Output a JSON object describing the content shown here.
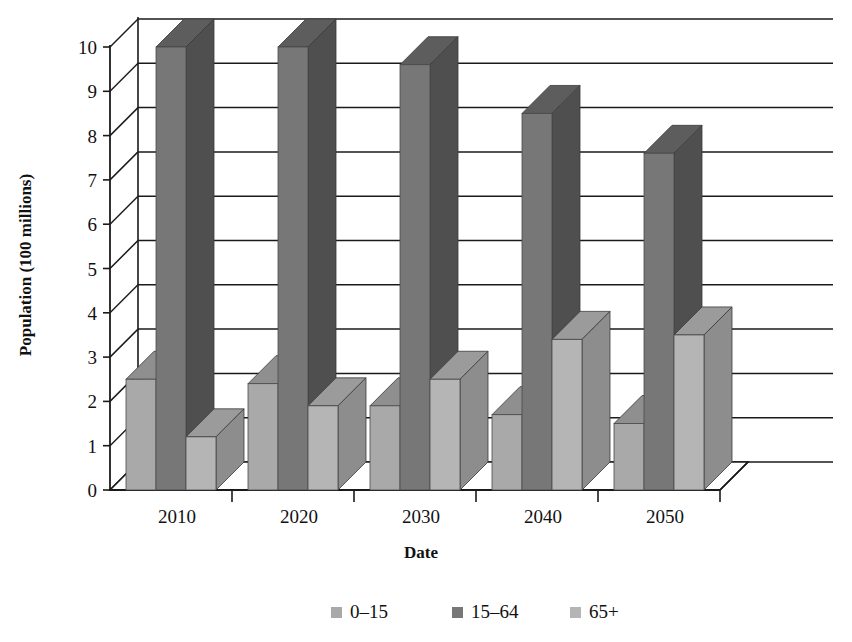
{
  "chart_data": {
    "type": "bar",
    "title": "",
    "subtitle": "",
    "xlabel": "Date",
    "ylabel": "Population (100 millions)",
    "categories": [
      "2010",
      "2020",
      "2030",
      "2040",
      "2050"
    ],
    "series": [
      {
        "name": "0–15",
        "values": [
          2.5,
          2.4,
          1.9,
          1.7,
          1.5
        ],
        "color": "#a9a9a9"
      },
      {
        "name": "15–64",
        "values": [
          10.0,
          10.0,
          9.6,
          8.5,
          7.6
        ],
        "color": "#777777"
      },
      {
        "name": "65+",
        "values": [
          1.2,
          1.9,
          2.5,
          3.4,
          3.5
        ],
        "color": "#b5b5b5"
      }
    ],
    "ylim": [
      0,
      10
    ],
    "ytick_labels": [
      "0",
      "1",
      "2",
      "3",
      "4",
      "5",
      "6",
      "7",
      "8",
      "9",
      "10"
    ],
    "ytick_values": [
      0,
      1,
      2,
      3,
      4,
      5,
      6,
      7,
      8,
      9,
      10
    ],
    "grid": true,
    "grid_axis": "y",
    "legend_position": "bottom",
    "style": "3d-column",
    "axis_color": "#1a1a1a",
    "background": "#ffffff"
  },
  "legend": {
    "items": [
      {
        "label": "0–15",
        "swatch_color": "#a9a9a9"
      },
      {
        "label": "15–64",
        "swatch_color": "#777777"
      },
      {
        "label": "65+",
        "swatch_color": "#b5b5b5"
      }
    ]
  },
  "axes": {
    "y": {
      "label": "Population (100 millions)",
      "ticks": [
        "0",
        "1",
        "2",
        "3",
        "4",
        "5",
        "6",
        "7",
        "8",
        "9",
        "10"
      ]
    },
    "x": {
      "label": "Date",
      "ticks": [
        "2010",
        "2020",
        "2030",
        "2040",
        "2050"
      ]
    }
  }
}
